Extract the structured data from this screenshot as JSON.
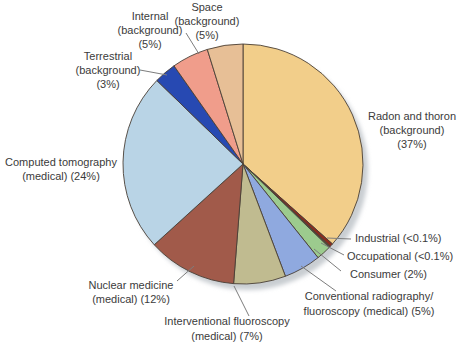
{
  "figure": {
    "description_label": "Pie chart of radiation exposure sources"
  },
  "chart_data": {
    "type": "pie",
    "title": "",
    "background": "#ffffff",
    "outline_color": "#4a4037",
    "leader_color": "#7d7d7d",
    "text_color": "#3b3b3b",
    "legend_position": "outside-labels-with-leader-lines",
    "center": {
      "x": 243,
      "y": 164,
      "r": 120
    },
    "shadow": {
      "dx": 5,
      "dy": 6,
      "color": "#c9ced2"
    },
    "start_angle_deg": 0,
    "direction": "clockwise",
    "total": 100,
    "slices": [
      {
        "id": "radon-and-thoron-background",
        "category": "Radon and thoron (background)",
        "percent_label": "37%",
        "value": 37,
        "sweep_deg": 131.8,
        "color": "#F2CE8A",
        "label_lines": [
          "Radon and thoron",
          "(background)",
          "(37%)"
        ],
        "label": {
          "x": 412,
          "y": 120,
          "align": "center",
          "line_height": 14
        },
        "leader": null
      },
      {
        "id": "industrial",
        "category": "Industrial",
        "percent_label": "<0.1%",
        "value": 0.1,
        "sweep_deg": 1.6,
        "color": "#8C2B1E",
        "label_lines": [
          "Industrial (<0.1%)"
        ],
        "label": {
          "x": 355,
          "y": 242,
          "align": "left",
          "line_height": 14
        },
        "leader": [
          327,
          238,
          351,
          239
        ]
      },
      {
        "id": "occupational",
        "category": "Occupational",
        "percent_label": "<0.1%",
        "value": 0.1,
        "sweep_deg": 0.7,
        "color": "#574836",
        "label_lines": [
          "Occupational (<0.1%)"
        ],
        "label": {
          "x": 347,
          "y": 260,
          "align": "left",
          "line_height": 14
        },
        "leader": [
          321,
          243,
          344,
          255
        ]
      },
      {
        "id": "consumer",
        "category": "Consumer",
        "percent_label": "2%",
        "value": 2,
        "sweep_deg": 7.2,
        "color": "#9CCB8E",
        "label_lines": [
          "Consumer (2%)"
        ],
        "label": {
          "x": 350,
          "y": 278,
          "align": "left",
          "line_height": 14
        },
        "leader": [
          314,
          249,
          341,
          271
        ]
      },
      {
        "id": "conventional-radiography-fluoroscopy-medical",
        "category": "Conventional radiography/fluoroscopy (medical)",
        "percent_label": "5%",
        "value": 5,
        "sweep_deg": 18,
        "color": "#8FA9DF",
        "label_lines": [
          "Conventional radiography/",
          "fluoroscopy (medical) (5%)"
        ],
        "label": {
          "x": 369,
          "y": 300,
          "align": "center",
          "line_height": 14.5
        },
        "leader": [
          301,
          266,
          336,
          291
        ]
      },
      {
        "id": "interventional-fluoroscopy-medical",
        "category": "Interventional fluoroscopy (medical)",
        "percent_label": "7%",
        "value": 7,
        "sweep_deg": 25.2,
        "color": "#C0BB90",
        "label_lines": [
          "Interventional fluoroscopy",
          "(medical) (7%)"
        ],
        "label": {
          "x": 227,
          "y": 325,
          "align": "center",
          "line_height": 14.5
        },
        "leader": [
          234,
          286,
          249,
          316
        ]
      },
      {
        "id": "nuclear-medicine-medical",
        "category": "Nuclear medicine (medical)",
        "percent_label": "12%",
        "value": 12,
        "sweep_deg": 43.2,
        "color": "#A15A4A",
        "label_lines": [
          "Nuclear medicine",
          "(medical) (12%)"
        ],
        "label": {
          "x": 131,
          "y": 289,
          "align": "center",
          "line_height": 14
        },
        "leader": [
          194,
          266,
          177,
          281
        ]
      },
      {
        "id": "computed-tomography-medical",
        "category": "Computed tomography (medical)",
        "percent_label": "24%",
        "value": 24,
        "sweep_deg": 86.4,
        "color": "#B9D4E6",
        "label_lines": [
          "Computed tomography",
          "(medical) (24%)"
        ],
        "label": {
          "x": 61,
          "y": 166,
          "align": "center",
          "line_height": 13.5
        },
        "leader": null
      },
      {
        "id": "terrestrial-background",
        "category": "Terrestrial (background)",
        "percent_label": "3%",
        "value": 3,
        "sweep_deg": 10.8,
        "color": "#2749B2",
        "label_lines": [
          "Terrestrial",
          "(background)",
          "(3%)"
        ],
        "label": {
          "x": 108,
          "y": 60,
          "align": "center",
          "line_height": 14
        },
        "leader": [
          167,
          75,
          140,
          70
        ]
      },
      {
        "id": "internal-background",
        "category": "Internal (background)",
        "percent_label": "5%",
        "value": 5,
        "sweep_deg": 17.8,
        "color": "#F09D8B",
        "label_lines": [
          "Internal",
          "(background)",
          "(5%)"
        ],
        "label": {
          "x": 150,
          "y": 20,
          "align": "center",
          "line_height": 14
        },
        "leader": [
          199,
          54,
          186,
          33
        ]
      },
      {
        "id": "space-background",
        "category": "Space (background)",
        "percent_label": "5%",
        "value": 5,
        "sweep_deg": 17.3,
        "color": "#E7BF96",
        "label_lines": [
          "Space",
          "(background)",
          "(5%)"
        ],
        "label": {
          "x": 207,
          "y": 11,
          "align": "center",
          "line_height": 14
        },
        "leader": null
      }
    ]
  }
}
